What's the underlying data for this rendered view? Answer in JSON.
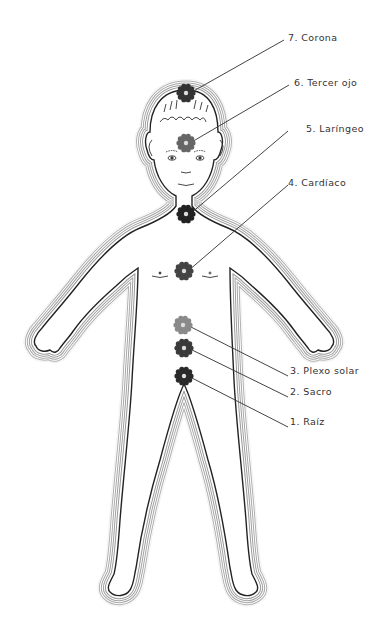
{
  "figure": {
    "type": "chakra-body-diagram",
    "line_color": "#222222",
    "aura_color": "#9a9a9a",
    "background": "#ffffff"
  },
  "chakras": [
    {
      "number": "7.",
      "name": "Corona",
      "label": "7. Corona",
      "symbol": "crown-chakra-icon",
      "cx": 186,
      "cy": 93,
      "r": 8,
      "fill": "#333333",
      "label_x": 288,
      "label_y": 37,
      "line_end_x": 284,
      "line_end_y": 40
    },
    {
      "number": "6.",
      "name": "Tercer ojo",
      "label": "6. Tercer ojo",
      "symbol": "third-eye-chakra-icon",
      "cx": 186,
      "cy": 143,
      "r": 8,
      "fill": "#666666",
      "label_x": 294,
      "label_y": 82,
      "line_end_x": 289,
      "line_end_y": 85
    },
    {
      "number": "5.",
      "name": "Laríngeo",
      "label": "5. Laríngeo",
      "symbol": "throat-chakra-icon",
      "cx": 186,
      "cy": 214,
      "r": 8,
      "fill": "#222222",
      "label_x": 306,
      "label_y": 128,
      "line_end_x": 288,
      "line_end_y": 131
    },
    {
      "number": "4.",
      "name": "Cardíaco",
      "label": "4. Cardíaco",
      "symbol": "heart-chakra-icon",
      "cx": 184,
      "cy": 271,
      "r": 8,
      "fill": "#444444",
      "label_x": 288,
      "label_y": 182,
      "line_end_x": 288,
      "line_end_y": 185
    },
    {
      "number": "3.",
      "name": "Plexo solar",
      "label": "3. Plexo solar",
      "symbol": "solar-plexus-chakra-icon",
      "cx": 183,
      "cy": 325,
      "r": 8,
      "fill": "#8a8a8a",
      "label_x": 290,
      "label_y": 370,
      "line_end_x": 288,
      "line_end_y": 376
    },
    {
      "number": "2.",
      "name": "Sacro",
      "label": "2. Sacro",
      "symbol": "sacral-chakra-icon",
      "cx": 184,
      "cy": 348,
      "r": 8,
      "fill": "#3a3a3a",
      "label_x": 290,
      "label_y": 391,
      "line_end_x": 288,
      "line_end_y": 397
    },
    {
      "number": "1.",
      "name": "Raíz",
      "label": "1. Raíz",
      "symbol": "root-chakra-icon",
      "cx": 184,
      "cy": 376,
      "r": 8,
      "fill": "#2a2a2a",
      "label_x": 290,
      "label_y": 421,
      "line_end_x": 288,
      "line_end_y": 427
    }
  ]
}
